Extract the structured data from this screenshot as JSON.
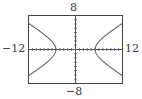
{
  "chart_data": {
    "type": "line",
    "title": "",
    "xlabel": "",
    "ylabel": "",
    "window": {
      "xmin": -12,
      "xmax": 12,
      "ymin": -8,
      "ymax": 8,
      "xscl": 1,
      "yscl": 1
    },
    "tick_labels": {
      "xmin": "−12",
      "xmax": "12",
      "ymin": "−8",
      "ymax": "8"
    },
    "grid": false,
    "legend": null,
    "series": [
      {
        "name": "hyperbola",
        "description": "Horizontal hyperbola centered at origin, vertices at (±5, 0)",
        "equation": "x^2/25 - y^2/8 = 1",
        "color": "#555555",
        "branches": [
          {
            "side": "right",
            "x": [
              5,
              5.5,
              6,
              7,
              8,
              9,
              10,
              11,
              12
            ],
            "y_upper": [
              0,
              1.18,
              1.88,
              2.77,
              3.53,
              4.23,
              4.9,
              5.54,
              6.16
            ]
          },
          {
            "side": "left",
            "x": [
              -5,
              -5.5,
              -6,
              -7,
              -8,
              -9,
              -10,
              -11,
              -12
            ],
            "y_upper": [
              0,
              1.18,
              1.88,
              2.77,
              3.53,
              4.23,
              4.9,
              5.54,
              6.16
            ]
          }
        ]
      }
    ]
  },
  "colors": {
    "frame": "#444444",
    "axes": "#555555",
    "curve": "#666666"
  }
}
